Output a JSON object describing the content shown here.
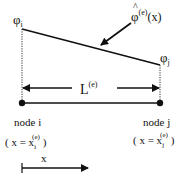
{
  "diagram": {
    "labels": {
      "phi_i": "φ",
      "phi_i_sub": "i",
      "phi_j": "φ",
      "phi_j_sub": "j",
      "phi_hat": "φ",
      "phi_hat_sup": "(e)",
      "phi_hat_arg": "(x)",
      "length": "L",
      "length_sup": "(e)",
      "node_i": "node i",
      "node_j": "node j",
      "node_i_coord_open": "( x = x",
      "node_i_coord_sub": "i",
      "node_i_coord_sup": "(e)",
      "node_i_coord_close": ")",
      "node_j_coord_open": "( x = x",
      "node_j_coord_sub": "j",
      "node_j_coord_sup": "(e)",
      "node_j_coord_close": ")",
      "axis": "x"
    },
    "colors": {
      "line": "#111111",
      "background": "#ffffff"
    }
  }
}
